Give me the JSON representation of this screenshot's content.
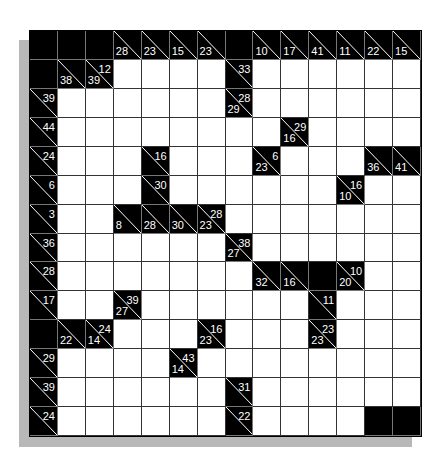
{
  "puzzle": {
    "type": "kakuro",
    "rows": 14,
    "cols": 14,
    "legend": "cell codes: '.' = white entry cell, '#' = black blocked cell, 'down\\right' = clue cell (down sum \\ right sum)",
    "grid": [
      [
        "#",
        "#",
        "#",
        "28\\",
        "23\\",
        "15\\",
        "23\\",
        "#",
        "10\\",
        "17\\",
        "41\\",
        "11\\",
        "22\\",
        "15\\"
      ],
      [
        "#",
        "38\\",
        "39\\12",
        ".",
        ".",
        ".",
        ".",
        "\\33",
        ".",
        ".",
        ".",
        ".",
        ".",
        "."
      ],
      [
        "\\39",
        ".",
        ".",
        ".",
        ".",
        ".",
        ".",
        "29\\28",
        ".",
        ".",
        ".",
        ".",
        ".",
        "."
      ],
      [
        "\\44",
        ".",
        ".",
        ".",
        ".",
        ".",
        ".",
        ".",
        ".",
        "16\\29",
        ".",
        ".",
        ".",
        "."
      ],
      [
        "\\24",
        ".",
        ".",
        ".",
        "\\16",
        ".",
        ".",
        ".",
        "23\\6",
        ".",
        ".",
        ".",
        "36\\",
        "41\\"
      ],
      [
        "\\6",
        ".",
        ".",
        ".",
        "\\30",
        ".",
        ".",
        ".",
        ".",
        ".",
        ".",
        "10\\16",
        ".",
        "."
      ],
      [
        "\\3",
        ".",
        ".",
        "8\\",
        "28\\",
        "30\\",
        "23\\28",
        ".",
        ".",
        ".",
        ".",
        ".",
        ".",
        "."
      ],
      [
        "\\36",
        ".",
        ".",
        ".",
        ".",
        ".",
        ".",
        "27\\38",
        ".",
        ".",
        ".",
        ".",
        ".",
        "."
      ],
      [
        "\\28",
        ".",
        ".",
        ".",
        ".",
        ".",
        ".",
        ".",
        "32\\",
        "16\\",
        "#",
        "20\\10",
        ".",
        "."
      ],
      [
        "\\17",
        ".",
        ".",
        "27\\39",
        ".",
        ".",
        ".",
        ".",
        ".",
        ".",
        "\\11",
        ".",
        ".",
        "."
      ],
      [
        "#",
        "22\\",
        "14\\24",
        ".",
        ".",
        ".",
        "23\\16",
        ".",
        ".",
        ".",
        "23\\23",
        ".",
        ".",
        "."
      ],
      [
        "\\29",
        ".",
        ".",
        ".",
        ".",
        "14\\43",
        ".",
        ".",
        ".",
        ".",
        ".",
        ".",
        ".",
        "."
      ],
      [
        "\\39",
        ".",
        ".",
        ".",
        ".",
        ".",
        ".",
        "\\31",
        ".",
        ".",
        ".",
        ".",
        ".",
        "."
      ],
      [
        "\\24",
        ".",
        ".",
        ".",
        ".",
        ".",
        ".",
        "\\22",
        ".",
        ".",
        ".",
        ".",
        "#",
        "#"
      ]
    ]
  },
  "colors": {
    "block": "#000000",
    "entry": "#ffffff",
    "clue_text": "#ffffff",
    "shadow": "#b8b8b8",
    "background": "#ffffff"
  }
}
